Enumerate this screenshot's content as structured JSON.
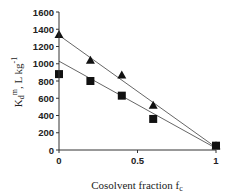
{
  "chart_data": {
    "type": "scatter",
    "title": "",
    "xlabel": "Cosolvent  fraction f",
    "xlabel_subscript": "c",
    "ylabel": "K",
    "ylabel_parts": {
      "main": "K",
      "sub": "d",
      "sup": "m",
      "unit": ", L kg",
      "unit_sup": "-1"
    },
    "xlim": [
      0,
      1
    ],
    "ylim": [
      0,
      1600
    ],
    "xticks": [
      0,
      0.5,
      1
    ],
    "xtick_labels": [
      "0",
      "0.5",
      "1"
    ],
    "yticks": [
      0,
      200,
      400,
      600,
      800,
      1000,
      1200,
      1400,
      1600
    ],
    "ytick_labels": [
      "0",
      "200",
      "400",
      "600",
      "800",
      "1000",
      "1200",
      "1400",
      "1600"
    ],
    "grid": false,
    "legend": null,
    "series": [
      {
        "name": "triangles",
        "marker": "triangle",
        "x": [
          0,
          0.2,
          0.4,
          0.6,
          1
        ],
        "values": [
          1340,
          1040,
          870,
          520,
          50
        ],
        "fit_line": {
          "x": [
            0,
            1
          ],
          "y": [
            1330,
            30
          ]
        }
      },
      {
        "name": "squares",
        "marker": "square",
        "x": [
          0,
          0.2,
          0.4,
          0.6,
          1
        ],
        "values": [
          880,
          800,
          630,
          360,
          50
        ],
        "fit_line": {
          "x": [
            0,
            1
          ],
          "y": [
            1030,
            20
          ]
        }
      }
    ]
  },
  "colors": {
    "marker": "#111111",
    "line": "#555555",
    "axis": "#333333"
  }
}
